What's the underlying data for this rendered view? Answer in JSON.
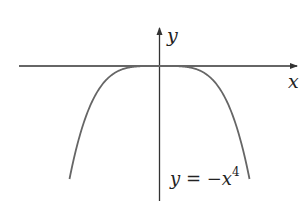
{
  "chart_data": {
    "type": "line",
    "title": "",
    "xlabel": "x",
    "ylabel": "y",
    "series": [
      {
        "name": "y = -x^4",
        "function": "y = -x^4",
        "x": [
          -1.0,
          -0.9,
          -0.8,
          -0.6,
          -0.4,
          -0.2,
          0,
          0.2,
          0.4,
          0.6,
          0.8,
          0.9,
          1.0
        ],
        "values": [
          -1.0,
          -0.6561,
          -0.4096,
          -0.1296,
          -0.0256,
          -0.0016,
          0,
          -0.0016,
          -0.0256,
          -0.1296,
          -0.4096,
          -0.6561,
          -1.0
        ]
      }
    ],
    "annotations": [
      {
        "text": "y = −x⁴",
        "position": "lower right of y-axis"
      }
    ],
    "grid": false,
    "legend": null,
    "xticks": [],
    "yticks": []
  },
  "labels": {
    "x_axis": "x",
    "y_axis": "y",
    "equation_var": "y",
    "equation_eq": " = −",
    "equation_x": "x",
    "equation_exp": "4"
  },
  "colors": {
    "axis": "#333333",
    "curve": "#666666",
    "text": "#222222"
  }
}
